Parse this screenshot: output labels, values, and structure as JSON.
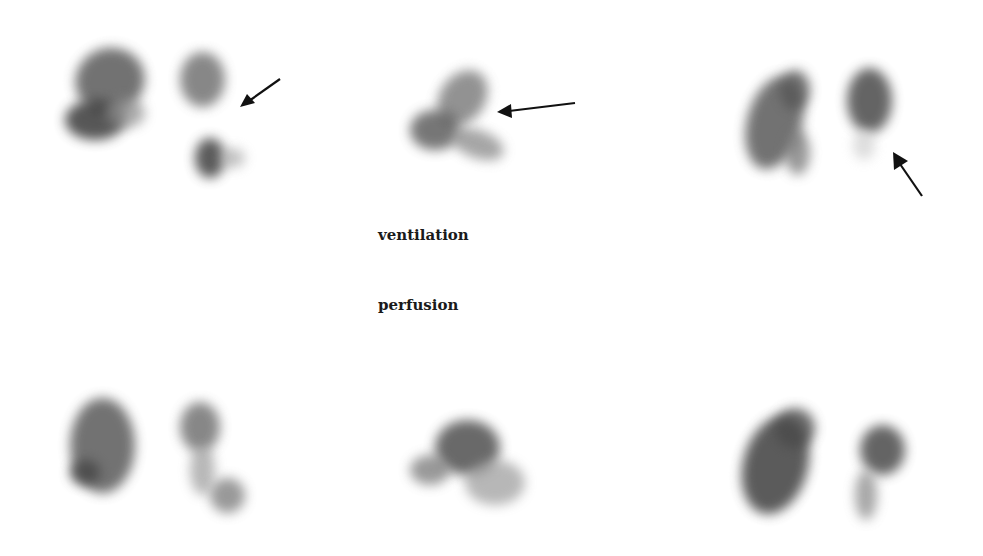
{
  "labels": {
    "top_row": "ventilation",
    "bottom_row": "perfusion"
  },
  "panels": {
    "ventilation": [
      {
        "view": "left",
        "arrow": true
      },
      {
        "view": "center",
        "arrow": true
      },
      {
        "view": "right",
        "arrow": true
      }
    ],
    "perfusion": [
      {
        "view": "left",
        "arrow": false
      },
      {
        "view": "center",
        "arrow": false
      },
      {
        "view": "right",
        "arrow": false
      }
    ]
  },
  "colors": {
    "background": "#ffffff",
    "uptake_dark": "#2a2a2a",
    "uptake_mid": "#6a6a6a",
    "arrow": "#111111"
  }
}
